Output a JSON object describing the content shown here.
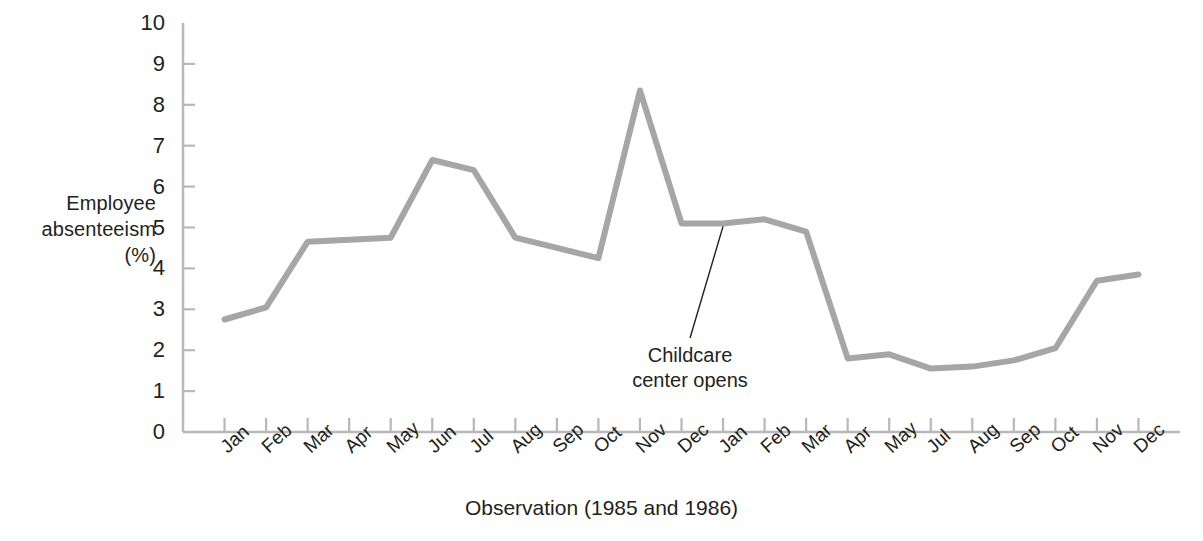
{
  "chart_data": {
    "type": "line",
    "title": "",
    "xlabel": "Observation (1985 and 1986)",
    "ylabel": "Employee absenteeism (%)",
    "ylabel_lines": [
      "Employee",
      "absenteeism",
      "(%)"
    ],
    "ylim": [
      0,
      10
    ],
    "yticks": [
      0,
      1,
      2,
      3,
      4,
      5,
      6,
      7,
      8,
      9,
      10
    ],
    "ytick_labels": [
      "0",
      "1",
      "2",
      "3",
      "4",
      "5",
      "6",
      "7",
      "8",
      "9",
      "10"
    ],
    "grid": false,
    "legend": "none",
    "categories": [
      "Jan",
      "Feb",
      "Mar",
      "Apr",
      "May",
      "Jun",
      "Jul",
      "Aug",
      "Sep",
      "Oct",
      "Nov",
      "Dec",
      "Jan",
      "Feb",
      "Mar",
      "Apr",
      "May",
      "Jul",
      "Aug",
      "Sep",
      "Oct",
      "Nov",
      "Dec"
    ],
    "series": [
      {
        "name": "Employee absenteeism (%)",
        "color": "#a6a6a6",
        "values": [
          2.75,
          3.05,
          4.65,
          4.7,
          4.75,
          6.65,
          6.4,
          4.75,
          4.5,
          4.25,
          8.35,
          5.1,
          5.1,
          5.2,
          4.9,
          1.8,
          1.9,
          1.55,
          1.6,
          1.75,
          2.05,
          3.7,
          3.85
        ]
      }
    ],
    "annotations": [
      {
        "text": "Childcare center opens",
        "lines": [
          "Childcare",
          "center opens"
        ],
        "points_at_category": "Jan",
        "points_at_value": 5.1
      }
    ],
    "axis_color": "#b3b3b3",
    "line_color": "#a6a6a6",
    "text_color": "#231f20"
  },
  "caption": {
    "figure_number": "",
    "text": ""
  }
}
